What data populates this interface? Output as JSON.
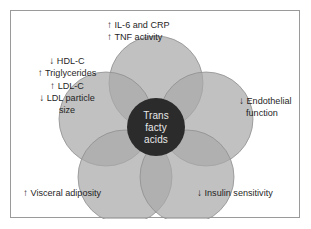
{
  "figure": {
    "center": {
      "lines": [
        "Trans",
        "facty",
        "acids"
      ]
    },
    "callouts": [
      {
        "id": "inflammation",
        "position": "top",
        "lines": [
          {
            "arrow": "↑",
            "direction": "up",
            "text": "IL-6 and CRP"
          },
          {
            "arrow": "↑",
            "direction": "up",
            "text": "TNF activity"
          }
        ]
      },
      {
        "id": "lipids",
        "position": "left",
        "lines": [
          {
            "arrow": "↓",
            "direction": "down",
            "text": "HDL-C"
          },
          {
            "arrow": "↑",
            "direction": "up",
            "text": "Triglycerides"
          },
          {
            "arrow": "↑",
            "direction": "up",
            "text": "LDL-C"
          },
          {
            "arrow": "↓",
            "direction": "down",
            "text": "LDL particle"
          },
          {
            "arrow": "",
            "direction": "none",
            "text": "size"
          }
        ]
      },
      {
        "id": "endothelial",
        "position": "right",
        "lines": [
          {
            "arrow": "↓",
            "direction": "down",
            "text": "Endothelial"
          },
          {
            "arrow": "",
            "direction": "none",
            "text": "function"
          }
        ]
      },
      {
        "id": "adiposity",
        "position": "bottom-left",
        "lines": [
          {
            "arrow": "↑",
            "direction": "up",
            "text": "Visceral adiposity"
          }
        ]
      },
      {
        "id": "insulin",
        "position": "bottom-right",
        "lines": [
          {
            "arrow": "↓",
            "direction": "down",
            "text": "Insulin sensitivity"
          }
        ]
      }
    ],
    "colors": {
      "circle_fill": "#a9a9a9",
      "circle_stroke": "#8f8f8f",
      "center_fill": "#2b2b2b",
      "frame_border": "#9a9a9a",
      "background": "#ffffff",
      "text": "#1f1f1f",
      "center_text": "#e8e8e8"
    },
    "venn": {
      "circle_count": 5,
      "layout": "pentagon",
      "circle_radius_px": 47,
      "center_circle_radius_px": 29
    }
  }
}
